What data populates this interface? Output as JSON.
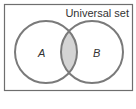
{
  "diagram": {
    "type": "venn",
    "universe_label": "Universal set",
    "sets": [
      {
        "id": "A",
        "label": "A"
      },
      {
        "id": "B",
        "label": "B"
      }
    ],
    "shaded_region": "A ∩ B",
    "colors": {
      "outline": "#7a7a7a",
      "frame": "#6e6e6e",
      "shade": "#d4d4d4",
      "background": "#ffffff",
      "text": "#333333"
    }
  }
}
